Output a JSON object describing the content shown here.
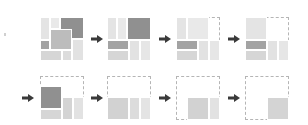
{
  "diagram": {
    "colors": {
      "light": "#e6e6e6",
      "mid": "#bdbdbd",
      "dark": "#8f8f8f",
      "outline": "#b5b5b5",
      "arrow": "#3a3a3a"
    },
    "panels": [
      {
        "id": 1,
        "row": 1,
        "x": 40,
        "y": 17,
        "dashed": false
      },
      {
        "id": 2,
        "row": 1,
        "x": 107,
        "y": 17,
        "dashed": false
      },
      {
        "id": 3,
        "row": 1,
        "x": 176,
        "y": 17,
        "dashed": true
      },
      {
        "id": 4,
        "row": 1,
        "x": 245,
        "y": 17,
        "dashed": true
      },
      {
        "id": 5,
        "row": 2,
        "x": 40,
        "y": 76,
        "dashed": true
      },
      {
        "id": 6,
        "row": 2,
        "x": 107,
        "y": 76,
        "dashed": true
      },
      {
        "id": 7,
        "row": 2,
        "x": 176,
        "y": 76,
        "dashed": true
      },
      {
        "id": 8,
        "row": 2,
        "x": 245,
        "y": 76,
        "dashed": true
      }
    ],
    "arrows": [
      {
        "from": 1,
        "to": 2
      },
      {
        "from": 2,
        "to": 3
      },
      {
        "from": 3,
        "to": 4
      },
      {
        "from": "start-row2",
        "to": 5
      },
      {
        "from": 5,
        "to": 6
      },
      {
        "from": 6,
        "to": 7
      },
      {
        "from": 7,
        "to": 8
      }
    ]
  }
}
